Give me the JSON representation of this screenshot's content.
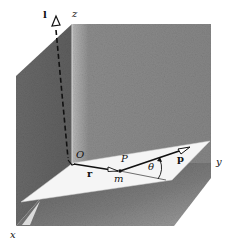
{
  "figure": {
    "labels": {
      "l_vector": "l",
      "z_axis": "z",
      "y_axis": "y",
      "x_axis": "x",
      "origin": "O",
      "point": "P",
      "mass": "m",
      "position_vector": "r",
      "momentum_vector": "p",
      "angle": "θ"
    },
    "colors": {
      "wall_left": "#6f6f6f",
      "wall_right": "#8a8a8a",
      "floor": "#7a7a7a",
      "plane": "#f4f4f4",
      "ink": "#111111",
      "background": "#ffffff"
    }
  }
}
